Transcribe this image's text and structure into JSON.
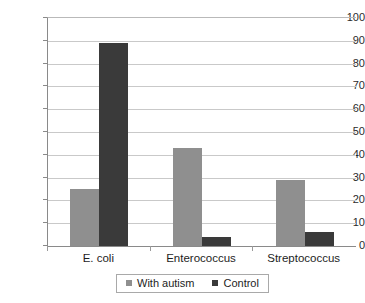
{
  "chart_data": {
    "type": "bar",
    "title": "",
    "subtitle": "",
    "xlabel": "",
    "ylabel": "",
    "categories": [
      "E. coli",
      "Enterococcus",
      "Streptococcus"
    ],
    "series": [
      {
        "name": "With autism",
        "color": "#8f8f8f",
        "values": [
          25,
          43,
          29
        ]
      },
      {
        "name": "Control",
        "color": "#3a3a3a",
        "values": [
          89,
          4,
          6
        ]
      }
    ],
    "ylim": [
      0,
      100
    ],
    "ytick_step": 10,
    "yticks": [
      100,
      90,
      80,
      70,
      60,
      50,
      40,
      30,
      20,
      10,
      0
    ],
    "ytick_labels": [
      "100",
      "90",
      "80",
      "70",
      "60",
      "50",
      "40",
      "30",
      "20",
      "10",
      "0"
    ],
    "grid": true,
    "grid_axis": "y",
    "legend_position": "bottom",
    "legend_entries": [
      "With autism",
      "Control"
    ],
    "annotations": []
  },
  "colors": {
    "background": "#ffffff",
    "series_autism": "#8f8f8f",
    "series_control": "#3a3a3a",
    "gridline": "#c9c9c9",
    "axis": "#8a8a8a",
    "text": "#1d1d1d",
    "legend_border": "#a9a9a9"
  }
}
